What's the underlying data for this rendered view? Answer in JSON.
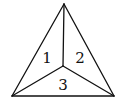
{
  "diagram": {
    "type": "triangle-subdivision",
    "vertices": {
      "apex": [
        64,
        4
      ],
      "bottom_left": [
        12,
        96
      ],
      "bottom_right": [
        114,
        96
      ],
      "center": [
        63,
        66
      ]
    },
    "regions": [
      {
        "label": "1",
        "pos": [
          47,
          63
        ]
      },
      {
        "label": "2",
        "pos": [
          80,
          63
        ]
      },
      {
        "label": "3",
        "pos": [
          63,
          90
        ]
      }
    ],
    "colors": {
      "stroke": "#111111",
      "background": "#ffffff"
    }
  }
}
